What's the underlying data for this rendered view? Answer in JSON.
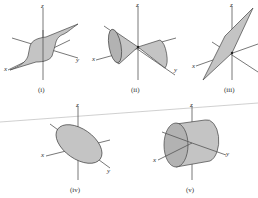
{
  "figure": {
    "panels": [
      {
        "id": "i",
        "caption": "(i)",
        "surface": "parabolic cylinder sheet",
        "axes": {
          "x": "x",
          "y": "y",
          "z": "z"
        }
      },
      {
        "id": "ii",
        "caption": "(ii)",
        "surface": "double cone",
        "axes": {
          "x": "x",
          "y": "",
          "z": "z"
        }
      },
      {
        "id": "iii",
        "caption": "(iii)",
        "surface": "plane",
        "axes": {
          "x": "x",
          "y": "y",
          "z": "z"
        }
      },
      {
        "id": "iv",
        "caption": "(iv)",
        "surface": "ellipse (elliptical disk)",
        "axes": {
          "x": "x",
          "y": "y",
          "z": "z"
        }
      },
      {
        "id": "v",
        "caption": "(v)",
        "surface": "circular cylinder",
        "axes": {
          "x": "x",
          "y": "y",
          "z": "z"
        }
      }
    ]
  }
}
